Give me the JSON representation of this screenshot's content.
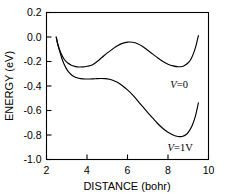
{
  "chart_data": {
    "type": "line",
    "title": "",
    "xlabel": "DISTANCE (bohr)",
    "ylabel": "ENERGY (eV)",
    "xlim": [
      2,
      10
    ],
    "ylim": [
      -1.0,
      0.2
    ],
    "xticks": [
      2,
      4,
      6,
      8,
      10
    ],
    "yticks": [
      0.2,
      0.0,
      -0.2,
      -0.4,
      -0.6,
      -0.8,
      -1.0
    ],
    "xtick_labels": [
      "2",
      "4",
      "6",
      "8",
      "10"
    ],
    "ytick_labels": [
      "0.2",
      "0.0",
      "-0.2",
      "-0.4",
      "-0.6",
      "-0.8",
      "-1.0"
    ],
    "grid": false,
    "legend_position": "inline-annotation",
    "line_color": "#000000",
    "background_color": "#ffffff",
    "series": [
      {
        "name": "V=0",
        "annotation": "𝒱=0",
        "annotation_symbol": "V",
        "annotation_text": "=0",
        "annotation_x": 8.55,
        "annotation_y": -0.42,
        "x": [
          2.48,
          2.55,
          2.65,
          2.75,
          2.85,
          2.95,
          3.05,
          3.2,
          3.4,
          3.6,
          3.8,
          4.0,
          4.25,
          4.5,
          4.75,
          5.0,
          5.25,
          5.5,
          5.75,
          6.0,
          6.25,
          6.5,
          6.75,
          7.0,
          7.25,
          7.5,
          7.75,
          8.0,
          8.25,
          8.5,
          8.75,
          9.0,
          9.15,
          9.3,
          9.4,
          9.5
        ],
        "y": [
          0.0,
          -0.055,
          -0.105,
          -0.145,
          -0.175,
          -0.197,
          -0.212,
          -0.228,
          -0.24,
          -0.245,
          -0.244,
          -0.239,
          -0.229,
          -0.2,
          -0.165,
          -0.13,
          -0.1,
          -0.072,
          -0.052,
          -0.042,
          -0.043,
          -0.055,
          -0.078,
          -0.108,
          -0.14,
          -0.172,
          -0.2,
          -0.222,
          -0.236,
          -0.243,
          -0.238,
          -0.21,
          -0.175,
          -0.115,
          -0.06,
          0.012
        ]
      },
      {
        "name": "V=1V",
        "annotation": "𝒱=1V",
        "annotation_symbol": "V",
        "annotation_text": "=1V",
        "annotation_x": 8.6,
        "annotation_y": -0.93,
        "x": [
          2.48,
          2.56,
          2.66,
          2.76,
          2.86,
          2.96,
          3.08,
          3.2,
          3.35,
          3.5,
          3.7,
          3.9,
          4.1,
          4.3,
          4.5,
          4.7,
          4.9,
          5.1,
          5.3,
          5.5,
          5.75,
          6.0,
          6.25,
          6.5,
          6.75,
          7.0,
          7.25,
          7.5,
          7.75,
          8.0,
          8.25,
          8.5,
          8.7,
          8.9,
          9.05,
          9.2,
          9.35,
          9.5
        ],
        "y": [
          0.0,
          -0.062,
          -0.122,
          -0.175,
          -0.218,
          -0.252,
          -0.283,
          -0.304,
          -0.322,
          -0.333,
          -0.34,
          -0.343,
          -0.343,
          -0.342,
          -0.34,
          -0.339,
          -0.34,
          -0.345,
          -0.355,
          -0.37,
          -0.398,
          -0.432,
          -0.472,
          -0.52,
          -0.568,
          -0.617,
          -0.663,
          -0.708,
          -0.747,
          -0.778,
          -0.8,
          -0.812,
          -0.812,
          -0.796,
          -0.766,
          -0.72,
          -0.648,
          -0.538
        ]
      }
    ]
  },
  "axis": {
    "x_title": "DISTANCE (bohr)",
    "y_title": "ENERGY (eV)"
  }
}
